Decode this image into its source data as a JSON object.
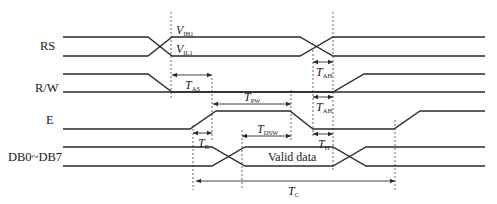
{
  "diagram": {
    "type": "timing-diagram",
    "signals": [
      {
        "id": "rs",
        "label": "RS"
      },
      {
        "id": "rw",
        "label": "R/W"
      },
      {
        "id": "e",
        "label": "E"
      },
      {
        "id": "db",
        "label": "DB0~DB7"
      }
    ],
    "annotations": {
      "vih": {
        "main": "V",
        "sub": "IH1"
      },
      "vil": {
        "main": "V",
        "sub": "IL1"
      },
      "tas": {
        "main": "T",
        "sub": "AS"
      },
      "tah_rs": {
        "main": "T",
        "sub": "AH"
      },
      "tah_rw": {
        "main": "T",
        "sub": "AH"
      },
      "tpw": {
        "main": "T",
        "sub": "PW"
      },
      "tdsw": {
        "main": "T",
        "sub": "DSW"
      },
      "tr": {
        "main": "T",
        "sub": "R"
      },
      "th": {
        "main": "T",
        "sub": "H"
      },
      "tc": {
        "main": "T",
        "sub": "C"
      }
    },
    "valid_data_label": "Valid data",
    "colors": {
      "line": "#2a2a2a",
      "background": "#ffffff"
    }
  }
}
